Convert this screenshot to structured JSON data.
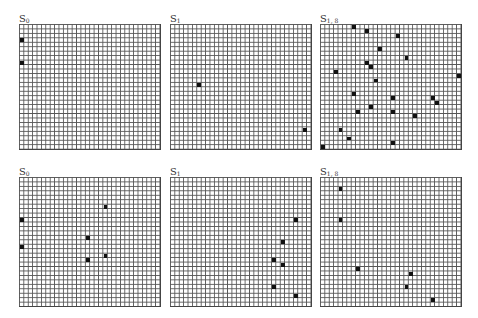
{
  "grid": {
    "cols": 32,
    "cell_w": 4.4,
    "cell_h": 4.46,
    "line_color": "#555555",
    "fill_color": "#111111"
  },
  "panels": [
    {
      "label_main": "S",
      "label_sub": "0",
      "x": 19,
      "y": 24,
      "rows": 28,
      "cells": [
        [
          0,
          3
        ],
        [
          0,
          8
        ]
      ]
    },
    {
      "label_main": "S",
      "label_sub": "1",
      "x": 170,
      "y": 24,
      "rows": 28,
      "cells": [
        [
          6,
          13
        ],
        [
          30,
          23
        ]
      ]
    },
    {
      "label_main": "S",
      "label_sub": "1, 8",
      "x": 320,
      "y": 24,
      "rows": 28,
      "cells": [
        [
          7,
          0
        ],
        [
          10,
          1
        ],
        [
          17,
          2
        ],
        [
          13,
          5
        ],
        [
          19,
          7
        ],
        [
          10,
          8
        ],
        [
          11,
          9
        ],
        [
          3,
          10
        ],
        [
          31,
          11
        ],
        [
          12,
          12
        ],
        [
          7,
          15
        ],
        [
          16,
          16
        ],
        [
          25,
          16
        ],
        [
          26,
          17
        ],
        [
          11,
          18
        ],
        [
          8,
          19
        ],
        [
          16,
          19
        ],
        [
          21,
          20
        ],
        [
          4,
          23
        ],
        [
          6,
          25
        ],
        [
          16,
          26
        ],
        [
          0,
          27
        ]
      ]
    },
    {
      "label_main": "S",
      "label_sub": "0",
      "x": 19,
      "y": 177,
      "rows": 29,
      "cells": [
        [
          0,
          9
        ],
        [
          0,
          15
        ],
        [
          19,
          6
        ],
        [
          15,
          13
        ],
        [
          19,
          17
        ],
        [
          15,
          18
        ]
      ]
    },
    {
      "label_main": "S",
      "label_sub": "1",
      "x": 170,
      "y": 177,
      "rows": 29,
      "cells": [
        [
          28,
          9
        ],
        [
          25,
          14
        ],
        [
          23,
          18
        ],
        [
          25,
          19
        ],
        [
          23,
          24
        ],
        [
          28,
          26
        ]
      ]
    },
    {
      "label_main": "S",
      "label_sub": "1, 8",
      "x": 320,
      "y": 177,
      "rows": 29,
      "cells": [
        [
          4,
          2
        ],
        [
          4,
          9
        ],
        [
          8,
          20
        ],
        [
          20,
          21
        ],
        [
          19,
          24
        ],
        [
          25,
          27
        ]
      ]
    }
  ]
}
